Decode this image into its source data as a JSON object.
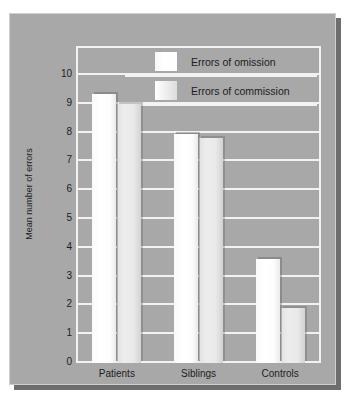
{
  "chart_data": {
    "type": "bar",
    "title": "",
    "xlabel": "",
    "ylabel": "Mean number of errors",
    "ylim": [
      0,
      10
    ],
    "ytick_labels": [
      "10",
      "9",
      "8",
      "7",
      "6",
      "5",
      "4",
      "3",
      "2",
      "1",
      "0"
    ],
    "yticks": [
      10,
      9,
      8,
      7,
      6,
      5,
      4,
      3,
      2,
      1,
      0
    ],
    "grid": true,
    "legend_position": "top-right",
    "categories": [
      "Patients",
      "Siblings",
      "Controls"
    ],
    "series": [
      {
        "name": "Errors of omission",
        "values": [
          9.35,
          7.95,
          3.6
        ]
      },
      {
        "name": "Errors of commission",
        "values": [
          9.0,
          7.8,
          1.9
        ]
      }
    ]
  },
  "legend": {
    "items": [
      {
        "label": "Errors of omission",
        "swatch": "legend-swatch-omission"
      },
      {
        "label": "Errors of commission",
        "swatch": "legend-swatch-commission"
      }
    ]
  },
  "colors": {
    "plate_background": "#a8a8a8",
    "grid_line": "#f2f2f2",
    "bar_omission": "#ffffff",
    "bar_commission": "#e6e6e6",
    "text": "#1d1d1d",
    "page_background": "#ffffff",
    "plate_shadow": "#6e6e6e"
  }
}
